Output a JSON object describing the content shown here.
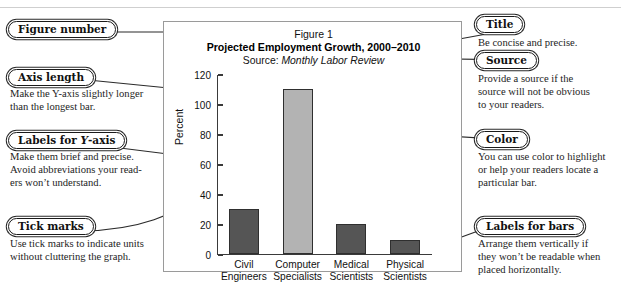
{
  "figure": {
    "number": "Figure 1",
    "title": "Projected Employment Growth, 2000–2010",
    "source_label": "Source: ",
    "source_name": "Monthly Labor Review"
  },
  "chart_data": {
    "type": "bar",
    "title": "Projected Employment Growth, 2000–2010",
    "subtitle": "Source: Monthly Labor Review",
    "xlabel": "",
    "ylabel": "Percent",
    "categories": [
      "Civil Engineers",
      "Computer Specialists",
      "Medical Scientists",
      "Physical Scientists"
    ],
    "category_lines": [
      [
        "Civil",
        "Engineers"
      ],
      [
        "Computer",
        "Specialists"
      ],
      [
        "Medical",
        "Scientists"
      ],
      [
        "Physical",
        "Scientists"
      ]
    ],
    "values": [
      30,
      110,
      20,
      9
    ],
    "ylim": [
      0,
      120
    ],
    "yticks": [
      0,
      20,
      40,
      60,
      80,
      100,
      120
    ],
    "ytick_labels": [
      "0",
      "20",
      "40",
      "60",
      "80",
      "100",
      "120"
    ],
    "grid": false,
    "legend": "none",
    "bar_colors": [
      "#555555",
      "#b3b3b3",
      "#555555",
      "#555555"
    ],
    "highlight_index": 1
  },
  "annotations": {
    "figure_number": {
      "label": "Figure number",
      "body": ""
    },
    "axis_length": {
      "label": "Axis length",
      "body": "Make the Y-axis slightly longer\nthan the longest bar."
    },
    "labels_y_axis": {
      "label_pre": "Labels for ",
      "label_italic": "Y",
      "label_post": "-axis",
      "body": "Make them brief and precise.\nAvoid abbreviations your read-\ners won’t understand."
    },
    "tick_marks": {
      "label": "Tick marks",
      "body": "Use tick marks to indicate units\nwithout cluttering the graph."
    },
    "title": {
      "label": "Title",
      "body": "Be concise and precise."
    },
    "source": {
      "label": "Source",
      "body": "Provide a source if the\nsource will not be obvious\nto your readers."
    },
    "color": {
      "label": "Color",
      "body": "You can use color to highlight\nor help your readers locate a\nparticular bar."
    },
    "labels_for_bars": {
      "label": "Labels for bars",
      "body": "Arrange them vertically if\nthey won’t be readable when\nplaced horizontally."
    }
  },
  "colors": {
    "bar_dark": "#555555",
    "bar_highlight": "#b3b3b3",
    "ink": "#1a1a1a",
    "panel_border": "#9a9a9a"
  }
}
